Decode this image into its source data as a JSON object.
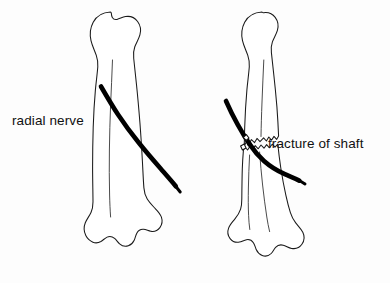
{
  "figure": {
    "background_color": "#fdfdfd",
    "ink_color": "#111111",
    "nerve_color": "#000000",
    "bone_fill": "#ffffff"
  },
  "labels": {
    "radial_nerve": "radial nerve",
    "fracture_of_shaft": "fracture of shaft"
  },
  "panels": [
    {
      "id": "left",
      "name": "intact-humerus",
      "description": "Intact humerus with radial nerve crossing the shaft obliquely",
      "fractured": false
    },
    {
      "id": "right",
      "name": "fractured-humerus",
      "description": "Humerus with mid-shaft fracture; radial nerve passes across the fracture site",
      "fractured": true
    }
  ],
  "structures": {
    "humerus_head": "humeral head",
    "greater_tubercle": "greater tubercle",
    "shaft": "shaft of humerus",
    "distal_condyles": "distal condyles",
    "radial_nerve": "radial nerve",
    "fracture_site": "fracture of shaft"
  }
}
